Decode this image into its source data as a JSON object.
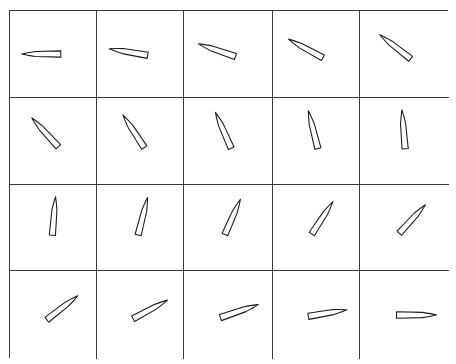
{
  "grid": {
    "rows": 4,
    "cols": 5,
    "line_color": "#3a3a3a",
    "background": "#ffffff"
  },
  "dagger": {
    "blade_fill": "#ffffff",
    "outline": "#1a1a1a",
    "handle_fill": "#2a2a2a",
    "length_px": 64
  },
  "cells": [
    {
      "index": 1,
      "row": 1,
      "col": 1,
      "angle_deg": 180.0
    },
    {
      "index": 2,
      "row": 1,
      "col": 2,
      "angle_deg": 189.5
    },
    {
      "index": 3,
      "row": 1,
      "col": 3,
      "angle_deg": 198.9
    },
    {
      "index": 4,
      "row": 1,
      "col": 4,
      "angle_deg": 208.4
    },
    {
      "index": 5,
      "row": 1,
      "col": 5,
      "angle_deg": 217.9
    },
    {
      "index": 6,
      "row": 2,
      "col": 1,
      "angle_deg": 227.4
    },
    {
      "index": 7,
      "row": 2,
      "col": 2,
      "angle_deg": 236.8
    },
    {
      "index": 8,
      "row": 2,
      "col": 3,
      "angle_deg": 246.3
    },
    {
      "index": 9,
      "row": 2,
      "col": 4,
      "angle_deg": 255.8
    },
    {
      "index": 10,
      "row": 2,
      "col": 5,
      "angle_deg": 265.3
    },
    {
      "index": 11,
      "row": 3,
      "col": 1,
      "angle_deg": 274.7
    },
    {
      "index": 12,
      "row": 3,
      "col": 2,
      "angle_deg": 284.2
    },
    {
      "index": 13,
      "row": 3,
      "col": 3,
      "angle_deg": 293.7
    },
    {
      "index": 14,
      "row": 3,
      "col": 4,
      "angle_deg": 303.2
    },
    {
      "index": 15,
      "row": 3,
      "col": 5,
      "angle_deg": 312.6
    },
    {
      "index": 16,
      "row": 4,
      "col": 1,
      "angle_deg": 322.1
    },
    {
      "index": 17,
      "row": 4,
      "col": 2,
      "angle_deg": 331.6
    },
    {
      "index": 18,
      "row": 4,
      "col": 3,
      "angle_deg": 341.1
    },
    {
      "index": 19,
      "row": 4,
      "col": 4,
      "angle_deg": 350.5
    },
    {
      "index": 20,
      "row": 4,
      "col": 5,
      "angle_deg": 360.0
    }
  ]
}
